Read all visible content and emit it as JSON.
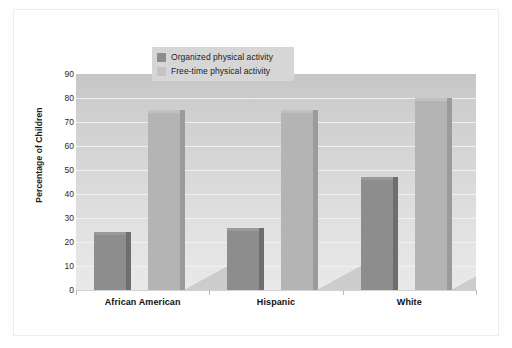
{
  "chart_data": {
    "type": "bar",
    "title": "",
    "xlabel": "",
    "ylabel": "Percentage of Children",
    "ylim": [
      0,
      90
    ],
    "ytick_values": [
      90,
      80,
      70,
      60,
      50,
      40,
      30,
      20,
      10,
      0
    ],
    "ytick_labels": [
      "90",
      "80",
      "70",
      "60",
      "50",
      "40",
      "30",
      "20",
      "10",
      "0"
    ],
    "categories": [
      "African American",
      "Hispanic",
      "White"
    ],
    "grid": true,
    "legend_position": "top-center",
    "series": [
      {
        "name": "Organized physical activity",
        "color": "#8d8d8d",
        "values": [
          24,
          26,
          47
        ]
      },
      {
        "name": "Free-time physical activity",
        "color": "#b4b4b4",
        "values": [
          75,
          75,
          80
        ]
      }
    ],
    "style": {
      "plot_background_top": "#c6c6c6",
      "plot_background_bottom": "#e9e9e9",
      "gridline_color": "#f2f2f2",
      "legend_background": "#d6d6d6",
      "figure_background": "#fefefe",
      "text_color": "#111111"
    }
  }
}
